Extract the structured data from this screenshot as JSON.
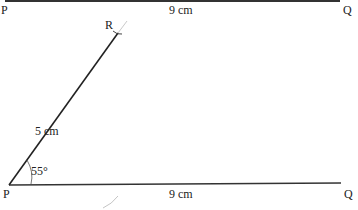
{
  "diagram": {
    "type": "geometric construction",
    "top_line": {
      "start_label": "P",
      "end_label": "Q",
      "length_label": "9 cm"
    },
    "bottom_figure": {
      "base_start_label": "P",
      "base_end_label": "Q",
      "base_length_label": "9 cm",
      "side_end_label": "R",
      "side_length_label": "5 cm",
      "angle_label": "55°"
    }
  }
}
